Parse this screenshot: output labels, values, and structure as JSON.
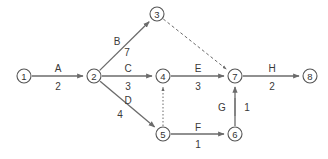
{
  "diagram": {
    "canvas": {
      "width": 328,
      "height": 159,
      "background": "#ffffff"
    },
    "colors": {
      "node_stroke": "#555555",
      "node_fill": "#ffffff",
      "edge_stroke": "#6b6b6b",
      "text": "#333333"
    },
    "nodes": [
      {
        "id": "1",
        "label": "1",
        "x": 24,
        "y": 76,
        "r": 7
      },
      {
        "id": "2",
        "label": "2",
        "x": 94,
        "y": 76,
        "r": 7
      },
      {
        "id": "3",
        "label": "3",
        "x": 157,
        "y": 14,
        "r": 7
      },
      {
        "id": "4",
        "label": "4",
        "x": 163,
        "y": 76,
        "r": 7
      },
      {
        "id": "5",
        "label": "5",
        "x": 163,
        "y": 134,
        "r": 7
      },
      {
        "id": "6",
        "label": "6",
        "x": 235,
        "y": 134,
        "r": 7
      },
      {
        "id": "7",
        "label": "7",
        "x": 235,
        "y": 76,
        "r": 7
      },
      {
        "id": "8",
        "label": "8",
        "x": 310,
        "y": 76,
        "r": 7
      }
    ],
    "edges": [
      {
        "id": "A",
        "name": "A",
        "duration": "2",
        "from": "1",
        "to": "2",
        "style": "solid",
        "name_x": 58,
        "name_y": 68,
        "dur_x": 58,
        "dur_y": 86
      },
      {
        "id": "B",
        "name": "B",
        "duration": "7",
        "from": "2",
        "to": "3",
        "style": "solid",
        "name_x": 117,
        "name_y": 41,
        "dur_x": 127,
        "dur_y": 52
      },
      {
        "id": "C",
        "name": "C",
        "duration": "3",
        "from": "2",
        "to": "4",
        "style": "solid",
        "name_x": 128,
        "name_y": 68,
        "dur_x": 128,
        "dur_y": 86
      },
      {
        "id": "D",
        "name": "D",
        "duration": "4",
        "from": "2",
        "to": "5",
        "style": "solid",
        "name_x": 128,
        "name_y": 100,
        "dur_x": 120,
        "dur_y": 114
      },
      {
        "id": "E",
        "name": "E",
        "duration": "3",
        "from": "4",
        "to": "7",
        "style": "solid",
        "name_x": 198,
        "name_y": 68,
        "dur_x": 198,
        "dur_y": 86
      },
      {
        "id": "F",
        "name": "F",
        "duration": "1",
        "from": "5",
        "to": "6",
        "style": "solid",
        "name_x": 198,
        "name_y": 127,
        "dur_x": 198,
        "dur_y": 144
      },
      {
        "id": "G",
        "name": "G",
        "duration": "1",
        "from": "6",
        "to": "7",
        "style": "solid",
        "name_x": 222,
        "name_y": 107,
        "dur_x": 247,
        "dur_y": 107
      },
      {
        "id": "H",
        "name": "H",
        "duration": "2",
        "from": "7",
        "to": "8",
        "style": "solid",
        "name_x": 272,
        "name_y": 68,
        "dur_x": 272,
        "dur_y": 86
      }
    ],
    "dummy_edges": [
      {
        "id": "dummy-3-7",
        "from": "3",
        "to": "7",
        "style": "dashed"
      },
      {
        "id": "dummy-5-4",
        "from": "5",
        "to": "4",
        "style": "dotted"
      }
    ]
  }
}
